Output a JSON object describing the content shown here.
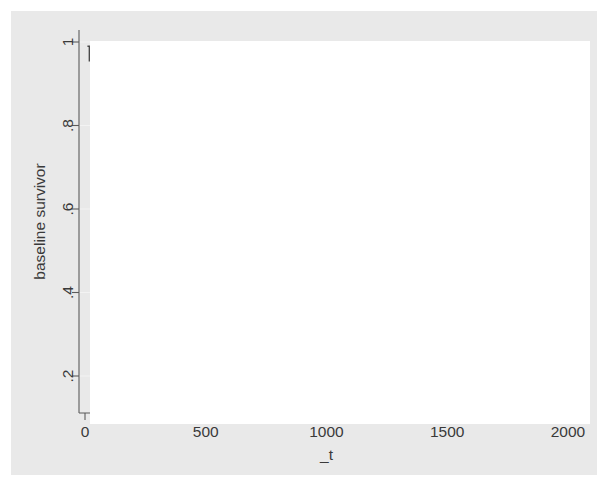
{
  "figure": {
    "background_color": "#ffffff",
    "graph_region_color": "#e9e9e9",
    "plot_region_color": "#ffffff",
    "line_color": "#4a4a4a",
    "grid_color": "#f3f3f3",
    "axis_color": "#5b5b5b"
  },
  "axes": {
    "x_title": "_t",
    "y_title": "baseline survivor",
    "x_ticks": [
      "0",
      "500",
      "1000",
      "1500",
      "2000"
    ],
    "y_ticks": [
      ".2",
      ".4",
      ".6",
      ".8",
      "1"
    ]
  },
  "chart_data": {
    "type": "line",
    "title": "",
    "subtitle": "",
    "xlabel": "_t",
    "ylabel": "baseline survivor",
    "xlim": [
      0,
      2000
    ],
    "ylim": [
      0.12,
      1.02
    ],
    "xticks": [
      0,
      500,
      1000,
      1500,
      2000
    ],
    "yticks": [
      0.2,
      0.4,
      0.6,
      0.8,
      1.0
    ],
    "grid": "horizontal",
    "legend": "none",
    "step": "post",
    "series": [
      {
        "name": "baseline survivor",
        "x": [
          10,
          18,
          26,
          34,
          42,
          50,
          58,
          66,
          74,
          82,
          90,
          96,
          102,
          108,
          114,
          120,
          132,
          146,
          160,
          172,
          186,
          198,
          210,
          222,
          236,
          248,
          262,
          276,
          290,
          300,
          312,
          322,
          332,
          342,
          352,
          500,
          585,
          600,
          640,
          680,
          700,
          720,
          740,
          760,
          800,
          840,
          870,
          900,
          940,
          965,
          980,
          990,
          1000,
          1015,
          1030,
          1045,
          1380,
          1400,
          1800
        ],
        "y": [
          0.99,
          0.955,
          0.92,
          0.885,
          0.85,
          0.815,
          0.78,
          0.735,
          0.7,
          0.66,
          0.62,
          0.59,
          0.56,
          0.535,
          0.51,
          0.478,
          0.462,
          0.462,
          0.45,
          0.442,
          0.428,
          0.42,
          0.412,
          0.398,
          0.383,
          0.372,
          0.368,
          0.358,
          0.348,
          0.34,
          0.332,
          0.322,
          0.312,
          0.3,
          0.3,
          0.3,
          0.3,
          0.288,
          0.288,
          0.288,
          0.262,
          0.262,
          0.248,
          0.248,
          0.248,
          0.232,
          0.228,
          0.222,
          0.222,
          0.222,
          0.205,
          0.19,
          0.178,
          0.172,
          0.16,
          0.148,
          0.148,
          0.14,
          0.14
        ]
      }
    ]
  }
}
